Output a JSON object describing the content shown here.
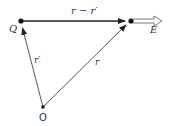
{
  "diagram": {
    "points": {
      "Q": {
        "label": "Q",
        "x": 21,
        "y": 21
      },
      "P": {
        "label": "",
        "x": 131,
        "y": 21
      },
      "O": {
        "label": "O",
        "x": 43,
        "y": 107
      }
    },
    "vectors": [
      {
        "name": "r-minus-r-prime",
        "label": "r − r′",
        "from": "Q",
        "to": "P"
      },
      {
        "name": "r-prime",
        "label": "r′",
        "from": "O",
        "to": "Q"
      },
      {
        "name": "r",
        "label": "r",
        "from": "O",
        "to": "P"
      }
    ],
    "field": {
      "label": "E",
      "from": "P",
      "direction": "right"
    },
    "colors": {
      "line": "#333333",
      "background": "#ffffff"
    }
  }
}
